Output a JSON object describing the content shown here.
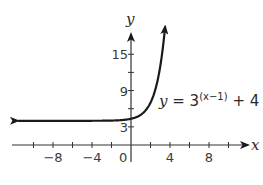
{
  "chart_data": {
    "type": "line",
    "title": "",
    "xlabel": "x",
    "ylabel": "y",
    "xlim": [
      -12,
      12
    ],
    "ylim": [
      0,
      18
    ],
    "x_ticks": [
      -10,
      -8,
      -6,
      -4,
      -2,
      0,
      2,
      4,
      6,
      8,
      10
    ],
    "x_tick_labels": [
      "-8",
      "-4",
      "0",
      "4",
      "8"
    ],
    "x_tick_label_values": [
      -8,
      -4,
      0,
      4,
      8
    ],
    "y_ticks": [
      3,
      6,
      9,
      12,
      15
    ],
    "y_tick_labels": [
      "3",
      "9",
      "15"
    ],
    "y_tick_label_values": [
      3,
      9,
      15
    ],
    "grid": false,
    "series": [
      {
        "name": "y = 3^(x-1) + 4",
        "function": "3^(x-1) + 4",
        "asymptote": 4,
        "x": [
          -12,
          -8,
          -4,
          -2,
          0,
          1,
          2,
          3,
          3.6
        ],
        "y": [
          4.0,
          4.0,
          4.0,
          4.04,
          4.33,
          5,
          7,
          13,
          21.4
        ],
        "arrow_left": true,
        "arrow_right": true
      }
    ],
    "annotations": [
      {
        "text_base": "y = 3",
        "text_sup": "(x−1)",
        "text_tail": " + 4"
      }
    ]
  },
  "axes": {
    "x_label": "x",
    "y_label": "y",
    "origin_label": "0"
  },
  "equation": {
    "y": "y",
    "eq": " = 3",
    "exp": "(x−1)",
    "tail": " + 4"
  }
}
